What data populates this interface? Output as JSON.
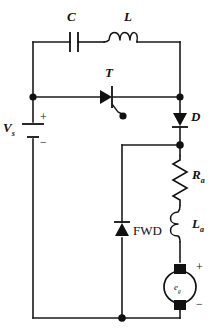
{
  "figure": {
    "type": "circuit-schematic",
    "title": ""
  },
  "components": {
    "capacitor": {
      "label": "C",
      "name": "capacitor",
      "symbol": "parallel-plate"
    },
    "inductor": {
      "label": "L",
      "name": "inductor",
      "symbol": "coil-3-turn"
    },
    "thyristor": {
      "label": "T",
      "name": "thyristor",
      "symbol": "scr-with-gate"
    },
    "diode": {
      "label": "D",
      "name": "diode",
      "symbol": "diode-down"
    },
    "freewheel_diode": {
      "label": "FWD",
      "name": "free-wheeling-diode",
      "symbol": "diode-up"
    },
    "armature_resistance": {
      "label": "R",
      "subscript": "a",
      "name": "armature-resistance",
      "symbol": "zigzag-resistor"
    },
    "armature_inductance": {
      "label": "L",
      "subscript": "a",
      "name": "armature-inductance",
      "symbol": "coil-2-turn"
    },
    "back_emf": {
      "label": "e",
      "subscript": "g",
      "name": "back-emf-source",
      "symbol": "circle-source",
      "plus": "+",
      "minus": "−"
    },
    "supply": {
      "label": "V",
      "subscript": "s",
      "name": "dc-supply",
      "symbol": "battery",
      "plus": "+",
      "minus": "−"
    }
  },
  "colors": {
    "wire": "#1a1a1a",
    "component": "#111111",
    "background": "#ffffff",
    "fill": "#111111"
  }
}
